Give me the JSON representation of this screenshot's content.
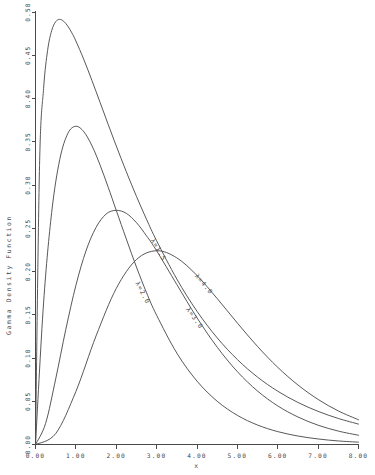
{
  "chart_data": {
    "type": "line",
    "title": "",
    "xlabel": "x",
    "ylabel": "Gamma Density Function",
    "xlim": [
      0.0,
      8.0
    ],
    "ylim": [
      0.0,
      0.5
    ],
    "grid": false,
    "legend_position": "inline-curve-labels",
    "x_ticks": [
      0.0,
      1.0,
      2.0,
      3.0,
      4.0,
      5.0,
      6.0,
      7.0,
      8.0
    ],
    "x_tick_labels": [
      "0.00",
      "1.00",
      "2.00",
      "3.00",
      "4.00",
      "5.00",
      "6.00",
      "7.00",
      "8.00"
    ],
    "y_ticks": [
      0.0,
      0.05,
      0.1,
      0.15,
      0.2,
      0.25,
      0.3,
      0.35,
      0.4,
      0.45,
      0.5
    ],
    "y_tick_labels": [
      "0.00",
      "0.05",
      "0.10",
      "0.15",
      "0.20",
      "0.25",
      "0.30",
      "0.35",
      "0.40",
      "0.45",
      "0.50"
    ],
    "series": [
      {
        "name": "λ=1.5",
        "label": "λ=1.5",
        "shape": 1.5,
        "scale": 1.0,
        "peak_x": 0.5,
        "peak_y": 0.4888,
        "x": [
          0.0,
          0.1,
          0.2,
          0.3,
          0.4,
          0.5,
          0.6,
          0.7,
          0.8,
          0.9,
          1.0,
          1.2,
          1.4,
          1.6,
          1.8,
          2.0,
          2.25,
          2.5,
          2.75,
          3.0,
          3.5,
          4.0,
          4.5,
          5.0,
          5.5,
          6.0,
          6.5,
          7.0,
          7.5,
          8.0
        ],
        "y": [
          0.0,
          0.3225,
          0.4113,
          0.4557,
          0.4784,
          0.4888,
          0.4915,
          0.4892,
          0.4837,
          0.4759,
          0.4665,
          0.4447,
          0.4205,
          0.3954,
          0.3701,
          0.3452,
          0.3153,
          0.2869,
          0.2603,
          0.2355,
          0.1913,
          0.154,
          0.1233,
          0.0982,
          0.0779,
          0.0616,
          0.0486,
          0.0383,
          0.0301,
          0.0236
        ]
      },
      {
        "name": "λ=2.0",
        "label": "λ=2.0",
        "shape": 2.0,
        "scale": 1.0,
        "peak_x": 1.0,
        "peak_y": 0.3679,
        "x": [
          0.0,
          0.2,
          0.4,
          0.6,
          0.8,
          1.0,
          1.2,
          1.4,
          1.6,
          1.8,
          2.0,
          2.25,
          2.5,
          2.75,
          3.0,
          3.5,
          4.0,
          4.5,
          5.0,
          5.5,
          6.0,
          6.5,
          7.0,
          7.5,
          8.0
        ],
        "y": [
          0.0,
          0.1637,
          0.2681,
          0.3293,
          0.3595,
          0.3679,
          0.3614,
          0.3452,
          0.323,
          0.2975,
          0.2707,
          0.2375,
          0.2052,
          0.1755,
          0.1494,
          0.1057,
          0.0733,
          0.05,
          0.0337,
          0.0225,
          0.0149,
          0.0098,
          0.0064,
          0.0041,
          0.0027
        ]
      },
      {
        "name": "λ=3.0",
        "label": "λ=3.0",
        "shape": 3.0,
        "scale": 1.0,
        "peak_x": 2.0,
        "peak_y": 0.2707,
        "x": [
          0.0,
          0.25,
          0.5,
          0.75,
          1.0,
          1.25,
          1.5,
          1.75,
          2.0,
          2.25,
          2.5,
          2.75,
          3.0,
          3.5,
          4.0,
          4.5,
          5.0,
          5.5,
          6.0,
          6.5,
          7.0,
          7.5,
          8.0
        ],
        "y": [
          0.0,
          0.0243,
          0.0758,
          0.1329,
          0.1839,
          0.2238,
          0.251,
          0.2665,
          0.2707,
          0.2672,
          0.2565,
          0.2412,
          0.224,
          0.185,
          0.1465,
          0.1125,
          0.0842,
          0.0618,
          0.0446,
          0.0318,
          0.0223,
          0.0155,
          0.0107
        ]
      },
      {
        "name": "λ=4.0",
        "label": "λ=4.0",
        "shape": 4.0,
        "scale": 1.0,
        "peak_x": 3.0,
        "peak_y": 0.224,
        "x": [
          0.0,
          0.5,
          1.0,
          1.5,
          2.0,
          2.5,
          3.0,
          3.5,
          4.0,
          4.5,
          5.0,
          5.5,
          6.0,
          6.5,
          7.0,
          7.5,
          8.0
        ],
        "y": [
          0.0,
          0.0126,
          0.0613,
          0.1255,
          0.1804,
          0.2138,
          0.224,
          0.2158,
          0.1954,
          0.1687,
          0.1404,
          0.1133,
          0.0892,
          0.0688,
          0.0521,
          0.0388,
          0.0286
        ]
      }
    ]
  },
  "axes": {
    "y_axis_title": "Gamma Density Function",
    "x_axis_title": "x"
  },
  "colors": {
    "curve": "#4f4f4f",
    "axis": "#4a4a4a",
    "text": "#474747",
    "background": "#ffffff"
  }
}
